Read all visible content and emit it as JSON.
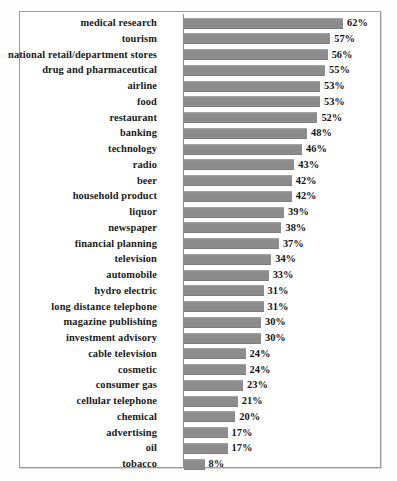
{
  "figure": {
    "background_color": "#fefefe",
    "frame_color": "#9a9a9a",
    "bar_color": "#8b8b8b",
    "text_color": "#1a1a1a",
    "axis_color": "#8d8d8d"
  },
  "chart_data": {
    "type": "bar",
    "orientation": "horizontal",
    "title": "",
    "subtitle": "",
    "xlabel": "",
    "ylabel": "",
    "xlim": [
      0,
      65
    ],
    "grid": false,
    "legend": null,
    "value_suffix": "%",
    "categories": [
      "medical research",
      "tourism",
      "national retail/department stores",
      "drug and pharmaceutical",
      "airline",
      "food",
      "restaurant",
      "banking",
      "technology",
      "radio",
      "beer",
      "household product",
      "liquor",
      "newspaper",
      "financial planning",
      "television",
      "automobile",
      "hydro electric",
      "long distance telephone",
      "magazine publishing",
      "investment advisory",
      "cable television",
      "cosmetic",
      "consumer gas",
      "cellular telephone",
      "chemical",
      "advertising",
      "oil",
      "tobacco"
    ],
    "values": [
      62,
      57,
      56,
      55,
      53,
      53,
      52,
      48,
      46,
      43,
      42,
      42,
      39,
      38,
      37,
      34,
      33,
      31,
      31,
      30,
      30,
      24,
      24,
      23,
      21,
      20,
      17,
      17,
      8
    ],
    "labels": [
      "62%",
      "57%",
      "56%",
      "55%",
      "53%",
      "53%",
      "52%",
      "48%",
      "46%",
      "43%",
      "42%",
      "42%",
      "39%",
      "38%",
      "37%",
      "34%",
      "33%",
      "31%",
      "31%",
      "30%",
      "30%",
      "24%",
      "24%",
      "23%",
      "21%",
      "20%",
      "17%",
      "17%",
      "8%"
    ]
  }
}
